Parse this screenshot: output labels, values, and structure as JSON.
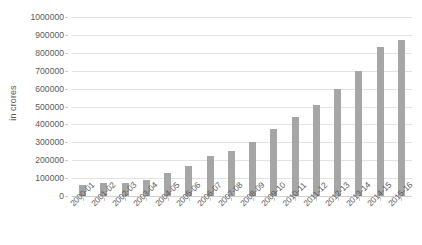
{
  "chart_data": {
    "type": "bar",
    "title": "",
    "xlabel": "",
    "ylabel": "in crores",
    "ylim": [
      0,
      1000000
    ],
    "ytick_step": 100000,
    "ytick_labels": [
      "0",
      "100000",
      "200000",
      "300000",
      "400000",
      "500000",
      "600000",
      "700000",
      "800000",
      "900000",
      "1000000"
    ],
    "grid": "horizontal",
    "legend": "none",
    "bar_color": "#a6a6a6",
    "categories": [
      "2000-01",
      "2001-02",
      "2002-03",
      "2003-04",
      "2004-05",
      "2005-06",
      "2006-07",
      "2007-08",
      "2008-09",
      "2009-10",
      "2010-11",
      "2011-12",
      "2012-13",
      "2013-14",
      "2014-15",
      "2015-16"
    ],
    "values": [
      60000,
      70000,
      75000,
      90000,
      130000,
      170000,
      225000,
      250000,
      300000,
      375000,
      440000,
      510000,
      600000,
      700000,
      830000,
      870000
    ]
  }
}
